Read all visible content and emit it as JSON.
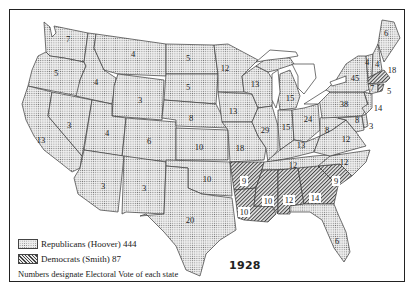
{
  "map": {
    "title_year": "1928",
    "subject": "Presidential election electoral vote map, United States",
    "legend": {
      "republican": {
        "label": "Republicans (Hoover) 444",
        "pattern": "dotted",
        "color": "#d8d8d8"
      },
      "democrat": {
        "label": "Democrats (Smith) 87",
        "pattern": "hatched",
        "color": "#555555"
      },
      "note": "Numbers designate Electoral Vote of each state"
    },
    "states": [
      {
        "name": "Washington",
        "ev": "7",
        "party": "R"
      },
      {
        "name": "Oregon",
        "ev": "5",
        "party": "R"
      },
      {
        "name": "California",
        "ev": "13",
        "party": "R"
      },
      {
        "name": "Idaho",
        "ev": "4",
        "party": "R"
      },
      {
        "name": "Nevada",
        "ev": "3",
        "party": "R"
      },
      {
        "name": "Montana",
        "ev": "4",
        "party": "R"
      },
      {
        "name": "Wyoming",
        "ev": "3",
        "party": "R"
      },
      {
        "name": "Utah",
        "ev": "4",
        "party": "R"
      },
      {
        "name": "Colorado",
        "ev": "6",
        "party": "R"
      },
      {
        "name": "Arizona",
        "ev": "3",
        "party": "R"
      },
      {
        "name": "New Mexico",
        "ev": "3",
        "party": "R"
      },
      {
        "name": "North Dakota",
        "ev": "5",
        "party": "R"
      },
      {
        "name": "South Dakota",
        "ev": "5",
        "party": "R"
      },
      {
        "name": "Nebraska",
        "ev": "8",
        "party": "R"
      },
      {
        "name": "Kansas",
        "ev": "10",
        "party": "R"
      },
      {
        "name": "Oklahoma",
        "ev": "10",
        "party": "R"
      },
      {
        "name": "Texas",
        "ev": "20",
        "party": "R"
      },
      {
        "name": "Minnesota",
        "ev": "12",
        "party": "R"
      },
      {
        "name": "Iowa",
        "ev": "13",
        "party": "R"
      },
      {
        "name": "Missouri",
        "ev": "18",
        "party": "R"
      },
      {
        "name": "Arkansas",
        "ev": "9",
        "party": "D"
      },
      {
        "name": "Louisiana",
        "ev": "10",
        "party": "D"
      },
      {
        "name": "Wisconsin",
        "ev": "13",
        "party": "R"
      },
      {
        "name": "Illinois",
        "ev": "29",
        "party": "R"
      },
      {
        "name": "Michigan",
        "ev": "15",
        "party": "R"
      },
      {
        "name": "Indiana",
        "ev": "15",
        "party": "R"
      },
      {
        "name": "Ohio",
        "ev": "24",
        "party": "R"
      },
      {
        "name": "Kentucky",
        "ev": "13",
        "party": "R"
      },
      {
        "name": "Tennessee",
        "ev": "12",
        "party": "R"
      },
      {
        "name": "Mississippi",
        "ev": "10",
        "party": "D"
      },
      {
        "name": "Alabama",
        "ev": "12",
        "party": "D"
      },
      {
        "name": "Georgia",
        "ev": "14",
        "party": "D"
      },
      {
        "name": "South Carolina",
        "ev": "9",
        "party": "D"
      },
      {
        "name": "Florida",
        "ev": "6",
        "party": "R"
      },
      {
        "name": "North Carolina",
        "ev": "12",
        "party": "R"
      },
      {
        "name": "Virginia",
        "ev": "12",
        "party": "R"
      },
      {
        "name": "West Virginia",
        "ev": "8",
        "party": "R"
      },
      {
        "name": "Pennsylvania",
        "ev": "38",
        "party": "R"
      },
      {
        "name": "New York",
        "ev": "45",
        "party": "R"
      },
      {
        "name": "New Jersey",
        "ev": "14",
        "party": "R"
      },
      {
        "name": "Delaware",
        "ev": "3",
        "party": "R"
      },
      {
        "name": "Maryland",
        "ev": "8",
        "party": "R"
      },
      {
        "name": "Vermont",
        "ev": "4",
        "party": "R"
      },
      {
        "name": "New Hampshire",
        "ev": "4",
        "party": "R"
      },
      {
        "name": "Maine",
        "ev": "6",
        "party": "R"
      },
      {
        "name": "Massachusetts",
        "ev": "18",
        "party": "D"
      },
      {
        "name": "Rhode Island",
        "ev": "5",
        "party": "D"
      },
      {
        "name": "Connecticut",
        "ev": "7",
        "party": "R"
      }
    ]
  }
}
